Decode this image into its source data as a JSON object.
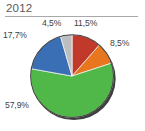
{
  "chart": {
    "title": "2012"
  },
  "chart_data": {
    "type": "pie",
    "title": "2012",
    "xlabel": "",
    "ylabel": "",
    "grid": false,
    "legend": "none",
    "labels_position": "outside",
    "start_angle_deg": 0,
    "direction": "clockwise",
    "categories": [
      "Segment 1",
      "Segment 2",
      "Segment 3",
      "Segment 4",
      "Segment 5"
    ],
    "values": [
      11.5,
      8.5,
      57.9,
      17.7,
      4.5
    ],
    "value_labels": [
      "11,5%",
      "8,5%",
      "57,9%",
      "17,7%",
      "4,5%"
    ],
    "colors": [
      "#c0392b",
      "#e8761e",
      "#4fb848",
      "#3a6eb5",
      "#bcbec0"
    ]
  },
  "style": {
    "title_color": "#58595b",
    "rule_color": "#a7a9ac",
    "label_color": "#414042",
    "background": "#ffffff",
    "pie_edge": "#3f3f3f"
  }
}
